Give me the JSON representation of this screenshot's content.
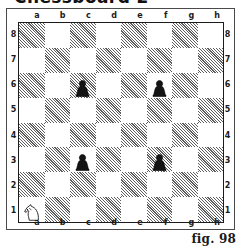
{
  "heading": {
    "text": "Chessboard 2",
    "note": "cropped-top-heading"
  },
  "figure": {
    "caption": "fig. 98"
  },
  "board": {
    "files": [
      "a",
      "b",
      "c",
      "d",
      "e",
      "f",
      "g",
      "h"
    ],
    "ranks": [
      "8",
      "7",
      "6",
      "5",
      "4",
      "3",
      "2",
      "1"
    ],
    "light_square_color": "#ffffff",
    "dark_square_color": "#5e5e5e",
    "border_color": "#1c1c1c",
    "orientation": "white-bottom",
    "dark_square_pattern": "diagonal-hatch",
    "a1_square_shade": "dark",
    "pieces": [
      {
        "square": "a1",
        "piece": "knight",
        "color": "white",
        "glyph": "white-knight-icon"
      },
      {
        "square": "c6",
        "piece": "pawn",
        "color": "black",
        "glyph": "black-pawn-icon"
      },
      {
        "square": "f6",
        "piece": "pawn",
        "color": "black",
        "glyph": "black-pawn-icon"
      },
      {
        "square": "c3",
        "piece": "pawn",
        "color": "black",
        "glyph": "black-pawn-icon"
      },
      {
        "square": "f3",
        "piece": "pawn",
        "color": "black",
        "glyph": "black-pawn-icon"
      }
    ]
  },
  "chart_data": {
    "type": "table",
    "title": "Chessboard 2",
    "xlabel": "files",
    "ylabel": "ranks",
    "categories": [
      "a",
      "b",
      "c",
      "d",
      "e",
      "f",
      "g",
      "h"
    ],
    "rows": [
      "8",
      "7",
      "6",
      "5",
      "4",
      "3",
      "2",
      "1"
    ],
    "grid": true,
    "legend": "none",
    "annotations": [
      "fig. 98"
    ],
    "occupancy": [
      [
        "",
        "",
        "",
        "",
        "",
        "",
        "",
        ""
      ],
      [
        "",
        "",
        "",
        "",
        "",
        "",
        "",
        ""
      ],
      [
        "",
        "",
        "black-pawn",
        "",
        "",
        "black-pawn",
        "",
        ""
      ],
      [
        "",
        "",
        "",
        "",
        "",
        "",
        "",
        ""
      ],
      [
        "",
        "",
        "",
        "",
        "",
        "",
        "",
        ""
      ],
      [
        "",
        "",
        "black-pawn",
        "",
        "",
        "black-pawn",
        "",
        ""
      ],
      [
        "",
        "",
        "",
        "",
        "",
        "",
        "",
        ""
      ],
      [
        "white-knight",
        "",
        "",
        "",
        "",
        "",
        "",
        ""
      ]
    ]
  }
}
